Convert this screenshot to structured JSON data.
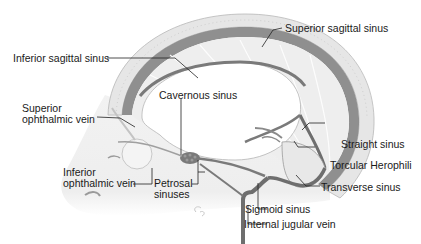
{
  "diagram": {
    "type": "anatomical-illustration",
    "colors": {
      "background": "#ffffff",
      "skull_outer": "#e4e4e4",
      "skull_inner": "#d0d0d0",
      "dura": "#8a8a8a",
      "sinus": "#6e6e6e",
      "brain_fill": "#ececec",
      "label_text": "#1a1a1a",
      "leader_line": "#222222"
    },
    "labels": {
      "superior_sagittal_sinus": "Superior sagittal sinus",
      "inferior_sagittal_sinus": "Inferior sagittal sinus",
      "superior_ophthalmic_vein_line1": "Superior",
      "superior_ophthalmic_vein_line2": "ophthalmic vein",
      "cavernous_sinus": "Cavernous sinus",
      "straight_sinus": "Straight sinus",
      "torcular_herophili": "Torcular Herophili",
      "transverse_sinus": "Transverse sinus",
      "inferior_ophthalmic_vein_line1": "Inferior",
      "inferior_ophthalmic_vein_line2": "ophthalmic vein",
      "petrosal_sinuses_line1": "Petrosal",
      "petrosal_sinuses_line2": "sinuses",
      "sigmoid_sinus": "Sigmoid sinus",
      "internal_jugular_vein": "Internal jugular vein"
    }
  }
}
